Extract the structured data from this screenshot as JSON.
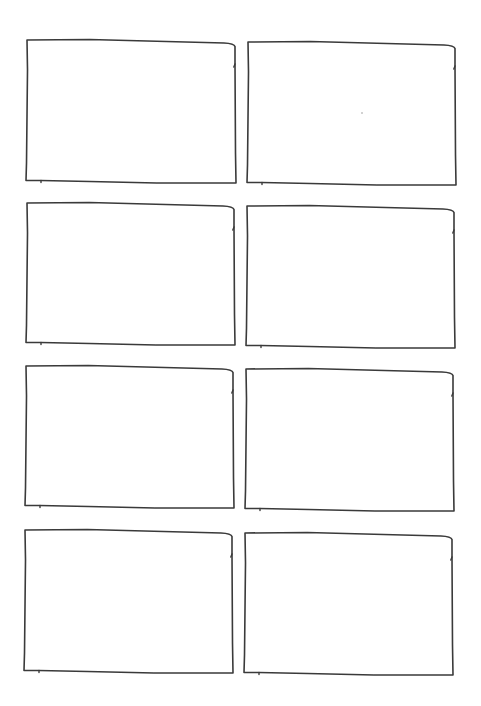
{
  "sheet": {
    "layout": "storyboard-grid",
    "rows": 4,
    "columns": 2,
    "stroke_color": "#3a3a3a",
    "background_color": "#ffffff"
  },
  "frames": [
    {
      "id": 1,
      "row": 1,
      "col": 1,
      "x1": 27,
      "y1": 40,
      "x2": 236,
      "y2": 183,
      "content": ""
    },
    {
      "id": 2,
      "row": 1,
      "col": 2,
      "x1": 248,
      "y1": 42,
      "x2": 456,
      "y2": 185,
      "content": ""
    },
    {
      "id": 3,
      "row": 2,
      "col": 1,
      "x1": 27,
      "y1": 203,
      "x2": 235,
      "y2": 345,
      "content": ""
    },
    {
      "id": 4,
      "row": 2,
      "col": 2,
      "x1": 247,
      "y1": 206,
      "x2": 455,
      "y2": 348,
      "content": ""
    },
    {
      "id": 5,
      "row": 3,
      "col": 1,
      "x1": 26,
      "y1": 366,
      "x2": 234,
      "y2": 508,
      "content": ""
    },
    {
      "id": 6,
      "row": 3,
      "col": 2,
      "x1": 246,
      "y1": 369,
      "x2": 454,
      "y2": 511,
      "content": ""
    },
    {
      "id": 7,
      "row": 4,
      "col": 1,
      "x1": 25,
      "y1": 530,
      "x2": 233,
      "y2": 673,
      "content": ""
    },
    {
      "id": 8,
      "row": 4,
      "col": 2,
      "x1": 245,
      "y1": 533,
      "x2": 453,
      "y2": 675,
      "content": ""
    }
  ]
}
